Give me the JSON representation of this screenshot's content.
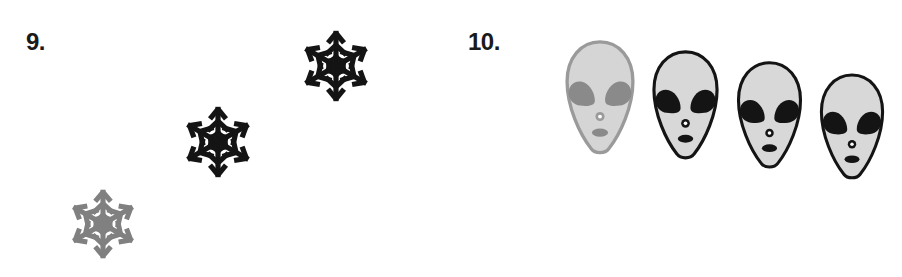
{
  "page": {
    "width": 902,
    "height": 277,
    "background": "#ffffff"
  },
  "palette": {
    "ink_black": "#1a1a1a",
    "shape_black": "#141414",
    "shape_gray": "#808080",
    "face_fill_light": "#d8d8d8",
    "face_fill_gray_variant": "#d5d5d5",
    "eye_gray": "#8a8a8a",
    "nose_hole_white": "#ffffff"
  },
  "exercises": [
    {
      "id": "exercise-9",
      "number_label": "9.",
      "label_position": {
        "x": 26,
        "y": 30
      },
      "icon_type": "snowflake",
      "item_count": 3,
      "arrangement": "ascending-diagonal-left-to-right",
      "items": [
        {
          "name": "snowflake-1",
          "color": "#808080",
          "tone": "gray",
          "x": 64,
          "y": 185,
          "size": 78,
          "order": 1
        },
        {
          "name": "snowflake-2",
          "color": "#141414",
          "tone": "black",
          "x": 178,
          "y": 102,
          "size": 80,
          "order": 2
        },
        {
          "name": "snowflake-3",
          "color": "#141414",
          "tone": "black",
          "x": 296,
          "y": 26,
          "size": 80,
          "order": 3
        }
      ]
    },
    {
      "id": "exercise-10",
      "number_label": "10.",
      "label_position": {
        "x": 468,
        "y": 30
      },
      "icon_type": "alien-head",
      "item_count": 4,
      "arrangement": "descending-staircase-left-to-right",
      "items": [
        {
          "name": "alien-head-1",
          "outline_color": "#9a9a9a",
          "face_fill": "#d5d5d5",
          "eye_color": "#8a8a8a",
          "mouth_color": "#8a8a8a",
          "nose_color": "#9a9a9a",
          "tone": "gray",
          "x": 563,
          "y": 39,
          "width": 74,
          "height": 120,
          "order": 1
        },
        {
          "name": "alien-head-2",
          "outline_color": "#141414",
          "face_fill": "#d8d8d8",
          "eye_color": "#141414",
          "mouth_color": "#141414",
          "nose_color": "#141414",
          "tone": "black",
          "x": 650,
          "y": 49,
          "width": 71,
          "height": 115,
          "order": 2
        },
        {
          "name": "alien-head-3",
          "outline_color": "#141414",
          "face_fill": "#d8d8d8",
          "eye_color": "#141414",
          "mouth_color": "#141414",
          "nose_color": "#141414",
          "tone": "black",
          "x": 735,
          "y": 60,
          "width": 69,
          "height": 113,
          "order": 3
        },
        {
          "name": "alien-head-4",
          "outline_color": "#141414",
          "face_fill": "#d8d8d8",
          "eye_color": "#141414",
          "mouth_color": "#141414",
          "nose_color": "#141414",
          "tone": "black",
          "x": 818,
          "y": 72,
          "width": 68,
          "height": 112,
          "order": 4
        }
      ]
    }
  ]
}
